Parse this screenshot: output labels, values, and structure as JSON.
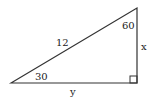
{
  "diagram": {
    "type": "right-triangle",
    "hypotenuse_label": "12",
    "angle_top_label": "60",
    "angle_bottom_left_label": "30",
    "vertical_side_label": "x",
    "horizontal_side_label": "y",
    "right_angle_marker": true,
    "stroke_color": "#333333"
  }
}
